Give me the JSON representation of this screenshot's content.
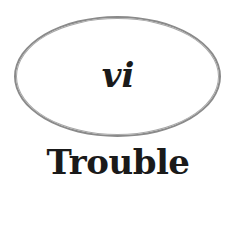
{
  "chapter": {
    "numeral": "vi",
    "title": "Trouble",
    "ring_color": "#8a8a8a",
    "text_color": "#1a1a1a"
  }
}
